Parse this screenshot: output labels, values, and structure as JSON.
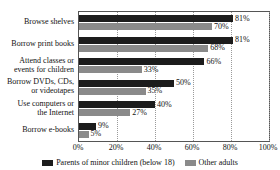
{
  "chart_data": {
    "type": "bar",
    "orientation": "horizontal",
    "title": "",
    "xlabel": "",
    "ylabel": "",
    "xlim": [
      0,
      100
    ],
    "xticks": [
      "0%",
      "20%",
      "40%",
      "60%",
      "80%",
      "100%"
    ],
    "xtick_values": [
      0,
      20,
      40,
      60,
      80,
      100
    ],
    "grid": true,
    "grid_axis": "x",
    "legend_position": "bottom",
    "value_suffix": "%",
    "categories": [
      "Browse shelves",
      "Borrow print books",
      "Attend classes or\nevents for children",
      "Borrow DVDs, CDs,\nor videotapes",
      "Use computers or\nthe Internet",
      "Borrow e-books"
    ],
    "series": [
      {
        "name": "Parents of minor children (below 18)",
        "color": "#1c1c1c",
        "values": [
          81,
          81,
          66,
          50,
          40,
          9
        ],
        "labels": [
          "81%",
          "81%",
          "66%",
          "50%",
          "40%",
          "9%"
        ]
      },
      {
        "name": "Other adults",
        "color": "#8a8a8a",
        "values": [
          70,
          68,
          33,
          35,
          27,
          5
        ],
        "labels": [
          "70%",
          "68%",
          "33%",
          "35%",
          "27%",
          "5%"
        ]
      }
    ]
  }
}
